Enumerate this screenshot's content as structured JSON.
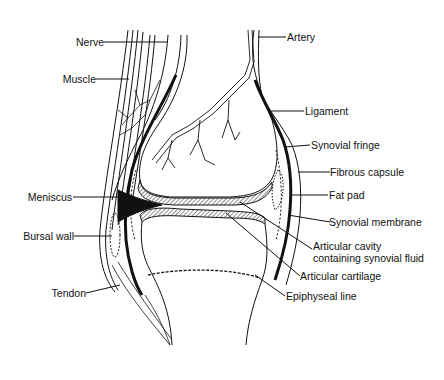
{
  "diagram": {
    "labels": {
      "nerve": "Nerve",
      "muscle": "Muscle",
      "meniscus": "Meniscus",
      "bursal_wall": "Bursal wall",
      "tendon": "Tendon",
      "artery": "Artery",
      "ligament": "Ligament",
      "synovial_fringe": "Synovial fringe",
      "fibrous_capsule": "Fibrous capsule",
      "fat_pad": "Fat pad",
      "synovial_membrane": "Synovial membrane",
      "articular_cavity_line1": "Articular cavity",
      "articular_cavity_line2": "containing synovial fluid",
      "articular_cartilage": "Articular cartilage",
      "epiphyseal_line": "Epiphyseal line"
    },
    "colors": {
      "ink": "#111111",
      "background": "#ffffff"
    }
  }
}
